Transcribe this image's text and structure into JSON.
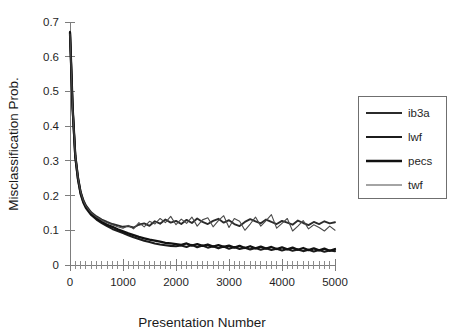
{
  "chart_data": {
    "type": "line",
    "title": "",
    "xlabel": "Presentation Number",
    "ylabel": "Misclassification Prob.",
    "xlim": [
      0,
      5000
    ],
    "ylim": [
      0,
      0.7
    ],
    "grid": false,
    "legend_position": "right",
    "x_ticks": [
      0,
      1000,
      2000,
      3000,
      4000,
      5000
    ],
    "x_tick_labels": [
      "0",
      "1000",
      "2000",
      "3000",
      "4000",
      "5000"
    ],
    "x_minor_step": 100,
    "y_ticks": [
      0,
      0.1,
      0.2,
      0.3,
      0.4,
      0.5,
      0.6,
      0.7
    ],
    "y_tick_labels": [
      "0",
      "0.1",
      "0.2",
      "0.3",
      "0.4",
      "0.5",
      "0.6",
      "0.7"
    ],
    "x": [
      0,
      50,
      100,
      150,
      200,
      250,
      300,
      400,
      500,
      600,
      700,
      800,
      900,
      1000,
      1100,
      1200,
      1300,
      1400,
      1500,
      1600,
      1700,
      1800,
      1900,
      2000,
      2100,
      2200,
      2300,
      2400,
      2500,
      2600,
      2700,
      2800,
      2900,
      3000,
      3100,
      3200,
      3300,
      3400,
      3500,
      3600,
      3700,
      3800,
      3900,
      4000,
      4100,
      4200,
      4300,
      4400,
      4500,
      4600,
      4700,
      4800,
      4900,
      5000
    ],
    "series": [
      {
        "name": "ib3a",
        "color": "#2b2b2b",
        "width": 1.9,
        "dash": "",
        "values": [
          0.672,
          0.455,
          0.318,
          0.255,
          0.212,
          0.188,
          0.172,
          0.152,
          0.14,
          0.131,
          0.124,
          0.118,
          0.114,
          0.11,
          0.112,
          0.108,
          0.116,
          0.12,
          0.113,
          0.126,
          0.119,
          0.131,
          0.122,
          0.127,
          0.118,
          0.13,
          0.121,
          0.134,
          0.124,
          0.118,
          0.127,
          0.133,
          0.122,
          0.129,
          0.118,
          0.112,
          0.124,
          0.132,
          0.126,
          0.12,
          0.131,
          0.124,
          0.118,
          0.127,
          0.122,
          0.116,
          0.128,
          0.121,
          0.115,
          0.124,
          0.118,
          0.126,
          0.12,
          0.123
        ]
      },
      {
        "name": "lwf",
        "color": "#1c1c1c",
        "width": 2.1,
        "dash": "",
        "values": [
          0.668,
          0.448,
          0.31,
          0.246,
          0.204,
          0.18,
          0.164,
          0.144,
          0.131,
          0.121,
          0.112,
          0.104,
          0.098,
          0.092,
          0.086,
          0.08,
          0.075,
          0.07,
          0.066,
          0.062,
          0.059,
          0.057,
          0.055,
          0.054,
          0.056,
          0.052,
          0.058,
          0.051,
          0.056,
          0.05,
          0.054,
          0.048,
          0.053,
          0.047,
          0.052,
          0.046,
          0.05,
          0.045,
          0.049,
          0.044,
          0.048,
          0.043,
          0.047,
          0.042,
          0.046,
          0.041,
          0.045,
          0.04,
          0.044,
          0.039,
          0.043,
          0.038,
          0.042,
          0.04
        ]
      },
      {
        "name": "pecs",
        "color": "#111111",
        "width": 2.3,
        "dash": "",
        "values": [
          0.67,
          0.452,
          0.314,
          0.25,
          0.208,
          0.184,
          0.168,
          0.147,
          0.134,
          0.124,
          0.116,
          0.11,
          0.103,
          0.097,
          0.091,
          0.086,
          0.081,
          0.077,
          0.073,
          0.07,
          0.067,
          0.064,
          0.062,
          0.06,
          0.058,
          0.062,
          0.056,
          0.06,
          0.055,
          0.059,
          0.053,
          0.057,
          0.052,
          0.056,
          0.05,
          0.055,
          0.049,
          0.054,
          0.048,
          0.053,
          0.047,
          0.052,
          0.046,
          0.051,
          0.045,
          0.05,
          0.044,
          0.049,
          0.043,
          0.048,
          0.042,
          0.047,
          0.041,
          0.046
        ]
      },
      {
        "name": "twf",
        "color": "#4a4a4a",
        "width": 1.1,
        "dash": "",
        "values": [
          0.665,
          0.45,
          0.316,
          0.252,
          0.21,
          0.186,
          0.17,
          0.15,
          0.138,
          0.129,
          0.122,
          0.116,
          0.11,
          0.106,
          0.114,
          0.104,
          0.122,
          0.11,
          0.126,
          0.118,
          0.134,
          0.122,
          0.14,
          0.116,
          0.132,
          0.12,
          0.138,
          0.112,
          0.13,
          0.136,
          0.11,
          0.128,
          0.142,
          0.108,
          0.134,
          0.126,
          0.1,
          0.118,
          0.138,
          0.112,
          0.128,
          0.145,
          0.106,
          0.12,
          0.134,
          0.098,
          0.112,
          0.128,
          0.104,
          0.116,
          0.108,
          0.098,
          0.112,
          0.1
        ]
      }
    ]
  },
  "legend": {
    "items": [
      {
        "label": "ib3a"
      },
      {
        "label": "lwf"
      },
      {
        "label": "pecs"
      },
      {
        "label": "twf"
      }
    ]
  }
}
